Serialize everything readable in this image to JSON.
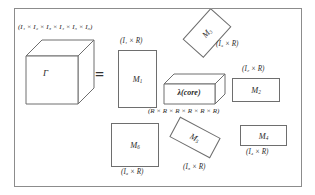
{
  "figure": {
    "equals_sign": "=",
    "tensor": {
      "symbol": "Γ",
      "dims_label": "(I₁ × I₂ × I₃ × I₄ × I₅ × I₆)"
    },
    "core": {
      "symbol": "λ(core)",
      "dims_label": "(R × R × R × R × R × R)"
    },
    "factors": [
      {
        "name": "M1",
        "symbol": "M",
        "subscript": "1",
        "dims_label": "(I₁ × R)",
        "orientation": "portrait"
      },
      {
        "name": "M2",
        "symbol": "M",
        "subscript": "2",
        "dims_label": "(I₂ × R)",
        "orientation": "landscape"
      },
      {
        "name": "M3",
        "symbol": "M",
        "subscript": "3",
        "dims_label": "(I₃ × R)",
        "orientation": "rotated"
      },
      {
        "name": "M4",
        "symbol": "M",
        "subscript": "4",
        "dims_label": "(I₄ × R)",
        "orientation": "landscape"
      },
      {
        "name": "M5",
        "symbol": "M",
        "subscript": "5",
        "dims_label": "(I₅ × R)",
        "orientation": "rotated"
      },
      {
        "name": "M6",
        "symbol": "M",
        "subscript": "6",
        "dims_label": "(I₆ × R)",
        "orientation": "square"
      }
    ],
    "colors": {
      "stroke": "#6e6e6e",
      "frame": "#8c8c8c",
      "text": "#2b2b2b",
      "background": "#ffffff"
    }
  }
}
